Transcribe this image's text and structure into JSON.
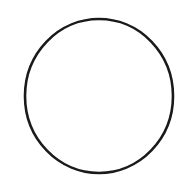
{
  "canvas": {
    "width": 184,
    "height": 178,
    "background": "#ffffff"
  },
  "shapes": [
    {
      "type": "circle-outline",
      "cx": 99,
      "cy": 96,
      "rx": 74,
      "ry": 77,
      "stroke": "#1a1a1a",
      "stroke_width": 2.6,
      "fill": "none"
    }
  ]
}
